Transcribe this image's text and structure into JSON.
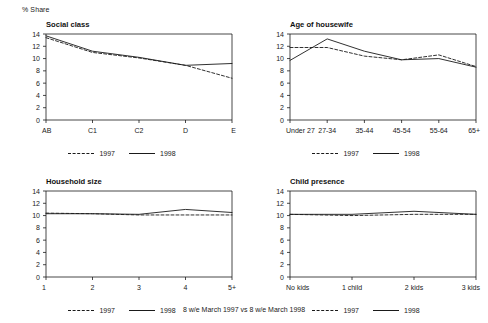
{
  "axis_unit_label": "% Share",
  "footnote": "8 w/e March 1997 vs 8 w/e March 1998",
  "legend": {
    "series_1_label": "1997",
    "series_2_label": "1998"
  },
  "colors": {
    "line": "#1a1a1a",
    "background": "#ffffff",
    "text": "#1a1a1a"
  },
  "y_ticks": [
    "0",
    "2",
    "4",
    "6",
    "8",
    "10",
    "12",
    "14"
  ],
  "chart_data": [
    {
      "type": "line",
      "title": "Social class",
      "xlabel": "",
      "ylabel": "% Share",
      "ylim": [
        0,
        14
      ],
      "grid": false,
      "legend_position": "bottom",
      "categories": [
        "AB",
        "C1",
        "C2",
        "D",
        "E"
      ],
      "series": [
        {
          "name": "1997",
          "style": "dashed",
          "values": [
            13.4,
            11.0,
            10.1,
            8.9,
            6.8
          ]
        },
        {
          "name": "1998",
          "style": "solid",
          "values": [
            13.7,
            11.2,
            10.2,
            8.9,
            9.2
          ]
        }
      ]
    },
    {
      "type": "line",
      "title": "Age of housewife",
      "xlabel": "",
      "ylabel": "% Share",
      "ylim": [
        0,
        14
      ],
      "grid": false,
      "legend_position": "bottom",
      "categories": [
        "Under 27",
        "27-34",
        "35-44",
        "45-54",
        "55-64",
        "65+"
      ],
      "series": [
        {
          "name": "1997",
          "style": "dashed",
          "values": [
            11.8,
            11.8,
            10.4,
            9.8,
            10.6,
            8.7
          ]
        },
        {
          "name": "1998",
          "style": "solid",
          "values": [
            9.7,
            13.2,
            11.2,
            9.8,
            10.0,
            8.6
          ]
        }
      ]
    },
    {
      "type": "line",
      "title": "Household size",
      "xlabel": "",
      "ylabel": "% Share",
      "ylim": [
        0,
        14
      ],
      "grid": false,
      "legend_position": "bottom",
      "categories": [
        "1",
        "2",
        "3",
        "4",
        "5+"
      ],
      "series": [
        {
          "name": "1997",
          "style": "dashed",
          "values": [
            10.4,
            10.3,
            10.1,
            10.1,
            10.1
          ]
        },
        {
          "name": "1998",
          "style": "solid",
          "values": [
            10.3,
            10.3,
            10.2,
            11.0,
            10.5
          ]
        }
      ]
    },
    {
      "type": "line",
      "title": "Child presence",
      "xlabel": "",
      "ylabel": "% Share",
      "ylim": [
        0,
        14
      ],
      "grid": false,
      "legend_position": "bottom",
      "categories": [
        "No kids",
        "1 child",
        "2 kids",
        "3 kids"
      ],
      "series": [
        {
          "name": "1997",
          "style": "dashed",
          "values": [
            10.2,
            10.0,
            10.2,
            10.2
          ]
        },
        {
          "name": "1998",
          "style": "solid",
          "values": [
            10.2,
            10.2,
            10.7,
            10.2
          ]
        }
      ]
    }
  ]
}
